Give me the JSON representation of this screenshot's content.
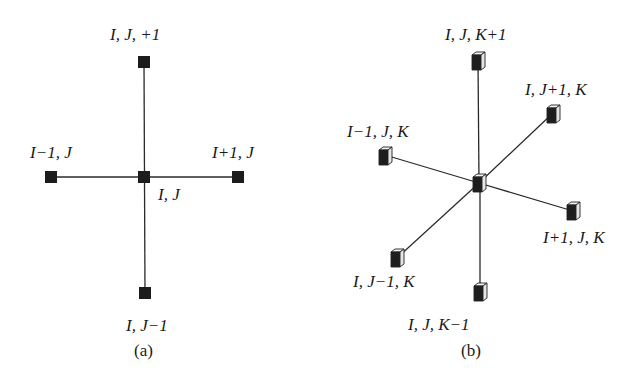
{
  "figure_a": {
    "caption": "(a)",
    "nodes": [
      {
        "id": "center",
        "label": "I, J",
        "x": 144,
        "y": 177,
        "label_x": 158,
        "label_y": 200
      },
      {
        "id": "top",
        "label": "I, J, +1",
        "x": 144,
        "y": 62,
        "label_x": 110,
        "label_y": 40
      },
      {
        "id": "bottom",
        "label": "I, J−1",
        "x": 145,
        "y": 293,
        "label_x": 126,
        "label_y": 331
      },
      {
        "id": "left",
        "label": "I−1, J",
        "x": 51,
        "y": 177,
        "label_x": 30,
        "label_y": 158
      },
      {
        "id": "right",
        "label": "I+1, J",
        "x": 238,
        "y": 177,
        "label_x": 212,
        "label_y": 158
      }
    ]
  },
  "figure_b": {
    "caption": "(b)",
    "nodes": [
      {
        "id": "center",
        "label": "",
        "x": 479,
        "y": 183
      },
      {
        "id": "k_plus",
        "label": "I, J, K+1",
        "x": 478,
        "y": 60,
        "label_x": 445,
        "label_y": 40
      },
      {
        "id": "j_plus",
        "label": "I, J+1, K",
        "x": 553,
        "y": 113,
        "label_x": 525,
        "label_y": 95
      },
      {
        "id": "i_minus",
        "label": "I−1, J, K",
        "x": 385,
        "y": 155,
        "label_x": 347,
        "label_y": 137
      },
      {
        "id": "i_plus",
        "label": "I+1, J, K",
        "x": 573,
        "y": 211,
        "label_x": 543,
        "label_y": 243
      },
      {
        "id": "j_minus",
        "label": "I, J−1, K",
        "x": 397,
        "y": 258,
        "label_x": 353,
        "label_y": 287
      },
      {
        "id": "k_minus",
        "label": "I, J, K−1",
        "x": 480,
        "y": 292,
        "label_x": 408,
        "label_y": 330
      }
    ]
  },
  "captions": {
    "a": "(a)",
    "b": "(b)"
  }
}
